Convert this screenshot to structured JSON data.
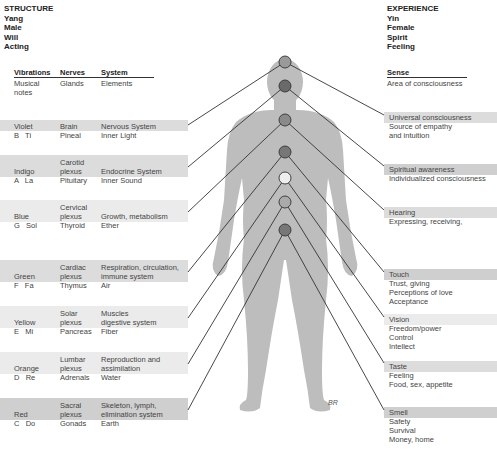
{
  "left_header": {
    "title": "STRUCTURE",
    "lines": [
      "Yang",
      "Male",
      "Will",
      "Acting"
    ]
  },
  "right_header": {
    "title": "EXPERIENCE",
    "lines": [
      "Yin",
      "Female",
      "Spirit",
      "Feeling"
    ]
  },
  "left_columns": {
    "col1": "Vibrations",
    "col2": "Nerves",
    "col3": "System",
    "sub1": "Musical notes",
    "sub1a": "Musical",
    "sub1b": "notes",
    "sub2": "Glands",
    "sub3": "Elements"
  },
  "right_columns": {
    "col1": "Sense",
    "sub1": "Area of consciousness"
  },
  "left_rows": [
    {
      "color": "Violet",
      "note": "B   Ti",
      "nerve1": "",
      "nerve2": "Brain",
      "gland": "Pineal",
      "system1": "",
      "system2": "Nervous System",
      "element": "Inner Light"
    },
    {
      "color": "Indigo",
      "note": "A   La",
      "nerve1": "Carotid",
      "nerve2": "plexus",
      "gland": "Pituitary",
      "system1": "",
      "system2": "Endocrine System",
      "element": "Inner Sound"
    },
    {
      "color": "Blue",
      "note": "G   Sol",
      "nerve1": "Cervical",
      "nerve2": "plexus",
      "gland": "Thyroid",
      "system1": "",
      "system2": "Growth, metabolism",
      "element": "Ether"
    },
    {
      "color": "Green",
      "note": "F   Fa",
      "nerve1": "Cardiac",
      "nerve2": "plexus",
      "gland": "Thymus",
      "system1": "Respiration, circulation,",
      "system2": "immune system",
      "element": "Air"
    },
    {
      "color": "Yellow",
      "note": "E   Mi",
      "nerve1": "Solar",
      "nerve2": "plexus",
      "gland": "Pancreas",
      "system1": "Muscles",
      "system2": "digestive system",
      "element": "Fiber"
    },
    {
      "color": "Orange",
      "note": "D   Re",
      "nerve1": "Lumbar",
      "nerve2": "plexus",
      "gland": "Adrenals",
      "system1": "Reproduction and",
      "system2": "assimilation",
      "element": "Water"
    },
    {
      "color": "Red",
      "note": "C   Do",
      "nerve1": "Sacral",
      "nerve2": "plexus",
      "gland": "Gonads",
      "system1": "Skeleton, lymph,",
      "system2": "elimination system",
      "element": "Earth"
    }
  ],
  "right_rows": [
    {
      "sense": "Universal consciousness",
      "lines": [
        "Source of empathy",
        "and intuition"
      ]
    },
    {
      "sense": "Spiritual awareness",
      "lines": [
        "Individualized consciousness"
      ]
    },
    {
      "sense": "Hearing",
      "lines": [
        "Expressing, receiving,"
      ]
    },
    {
      "sense": "Touch",
      "lines": [
        "Trust, giving",
        "Perceptions of love",
        "Acceptance"
      ]
    },
    {
      "sense": "Vision",
      "lines": [
        "Freedom/power",
        "Control",
        "Intellect"
      ]
    },
    {
      "sense": "Taste",
      "lines": [
        "Feeling",
        "Food, sex, appetite"
      ]
    },
    {
      "sense": "Smell",
      "lines": [
        "Safety",
        "Survival",
        "Money, home"
      ]
    }
  ],
  "chakras": [
    {
      "name": "crown",
      "y": 62,
      "fill": "#9a9a9a"
    },
    {
      "name": "brow",
      "y": 86,
      "fill": "#6a6a6a"
    },
    {
      "name": "throat",
      "y": 120,
      "fill": "#8a8a8a"
    },
    {
      "name": "heart",
      "y": 152,
      "fill": "#777777"
    },
    {
      "name": "solar-plexus",
      "y": 178,
      "fill": "#eeeeee"
    },
    {
      "name": "sacral",
      "y": 202,
      "fill": "#aaaaaa"
    },
    {
      "name": "root",
      "y": 230,
      "fill": "#777777"
    }
  ],
  "signature": "BR",
  "colors": {
    "band": "#dcdcdc",
    "figure": "#bdbdbd",
    "line": "#333333"
  }
}
